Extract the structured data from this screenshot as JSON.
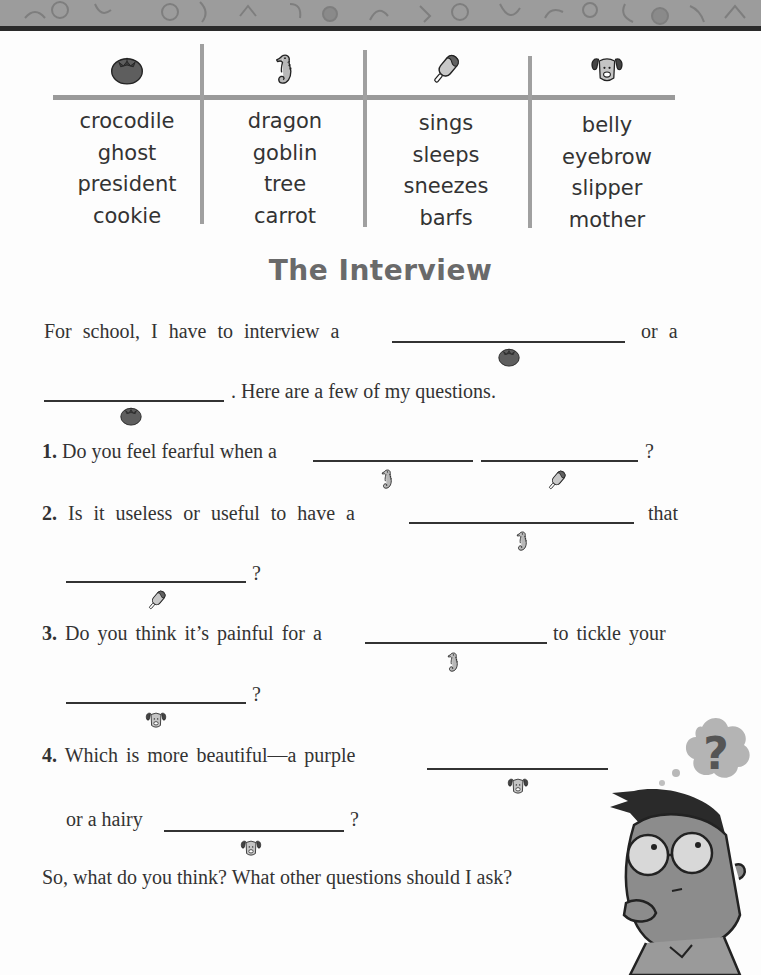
{
  "header_band": {
    "pattern": "school-doodles",
    "color": "#9c9c9c",
    "edge_color": "#2a2a2a"
  },
  "word_table": {
    "columns": [
      {
        "icon": "tomato-icon",
        "words": [
          "crocodile",
          "ghost",
          "president",
          "cookie"
        ]
      },
      {
        "icon": "seahorse-icon",
        "words": [
          "dragon",
          "goblin",
          "tree",
          "carrot"
        ]
      },
      {
        "icon": "popsicle-icon",
        "words": [
          "sings",
          "sleeps",
          "sneezes",
          "barfs"
        ]
      },
      {
        "icon": "dog-icon",
        "words": [
          "belly",
          "eyebrow",
          "slipper",
          "mother"
        ]
      }
    ]
  },
  "title": "The Interview",
  "story": {
    "intro_line1_a": "For school, I have to interview a",
    "intro_line1_b": "or a",
    "intro_line2": ". Here are a few of my questions.",
    "q1_num": "1.",
    "q1_text": "Do you feel fearful when a",
    "q1_end": "?",
    "q2_num": "2.",
    "q2_text": "Is it useless or useful to have a",
    "q2_mid": "that",
    "q2_end": "?",
    "q3_num": "3.",
    "q3_text": "Do you think it’s painful for a",
    "q3_mid": "to tickle your",
    "q3_end": "?",
    "q4_num": "4.",
    "q4_text": "Which is more beautiful—a purple",
    "q4_line2": "or a hairy",
    "q4_end": "?",
    "closing": "So, what do you think? What other questions should I ask?"
  },
  "blanks": [
    {
      "id": "intro-blank-1",
      "icon": "tomato-icon"
    },
    {
      "id": "intro-blank-2",
      "icon": "tomato-icon"
    },
    {
      "id": "q1-blank-1",
      "icon": "seahorse-icon"
    },
    {
      "id": "q1-blank-2",
      "icon": "popsicle-icon"
    },
    {
      "id": "q2-blank-1",
      "icon": "seahorse-icon"
    },
    {
      "id": "q2-blank-2",
      "icon": "popsicle-icon"
    },
    {
      "id": "q3-blank-1",
      "icon": "seahorse-icon"
    },
    {
      "id": "q3-blank-2",
      "icon": "dog-icon"
    },
    {
      "id": "q4-blank-1",
      "icon": "dog-icon"
    },
    {
      "id": "q4-blank-2",
      "icon": "dog-icon"
    }
  ],
  "illustration": {
    "subject": "thinking-boy-with-glasses",
    "thought_bubble": "?"
  }
}
